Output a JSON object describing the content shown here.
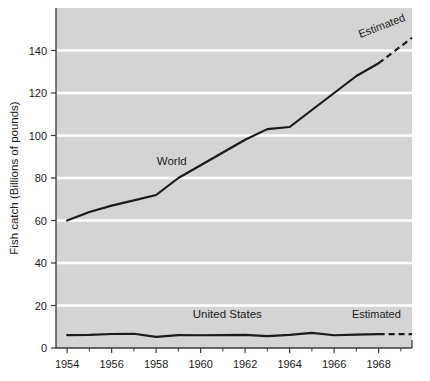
{
  "chart_data": {
    "type": "line",
    "title": "",
    "xlabel": "",
    "ylabel": "Fish catch (Billions of pounds)",
    "xlim": [
      1953.5,
      1969.5
    ],
    "ylim": [
      0,
      160
    ],
    "grid": true,
    "grid_color": "#ffffff",
    "plot_background": "#d4d4d4",
    "legend_position": "inline-annotations",
    "x_tick_labels": [
      "1954",
      "1956",
      "1958",
      "1960",
      "1962",
      "1964",
      "1966",
      "1968"
    ],
    "x_tick_values": [
      1954,
      1956,
      1958,
      1960,
      1962,
      1964,
      1966,
      1968
    ],
    "x_minor_ticks": [
      1955,
      1957,
      1959,
      1961,
      1963,
      1965,
      1967,
      1969
    ],
    "y_tick_labels": [
      "0",
      "20",
      "40",
      "60",
      "80",
      "100",
      "120",
      "140"
    ],
    "y_tick_values": [
      0,
      20,
      40,
      60,
      80,
      100,
      120,
      140
    ],
    "x": [
      1954,
      1955,
      1956,
      1957,
      1958,
      1959,
      1960,
      1961,
      1962,
      1963,
      1964,
      1965,
      1966,
      1967,
      1968,
      1969
    ],
    "series": [
      {
        "name": "World",
        "label": "World",
        "color": "#1a1a1a",
        "values": [
          60,
          64,
          67,
          69.5,
          72,
          80,
          86,
          92,
          98,
          103,
          104,
          112,
          120,
          128,
          134,
          140
        ],
        "solid_until": 1968,
        "estimated_label": "Estimated",
        "estimated_values": [
          140,
          146
        ]
      },
      {
        "name": "United States",
        "label": "United States",
        "color": "#1a1a1a",
        "values": [
          6.1,
          6.2,
          6.6,
          6.7,
          5.2,
          6.1,
          6.0,
          6.1,
          6.2,
          5.6,
          6.2,
          7.1,
          6.0,
          6.3,
          6.5,
          6.5
        ],
        "solid_until": 1968,
        "estimated_label": "Estimated",
        "estimated_values": [
          6.5,
          6.5
        ]
      }
    ],
    "annotations": [
      {
        "text": "World",
        "x": 1958.7,
        "y": 86,
        "rotation": 0
      },
      {
        "text": "United States",
        "x": 1961.2,
        "y": 14,
        "rotation": 0
      },
      {
        "text": "Estimated",
        "x": 1968.2,
        "y": 150,
        "rotation": -21
      },
      {
        "text": "Estimated",
        "x": 1967.9,
        "y": 14,
        "rotation": 0
      }
    ]
  }
}
